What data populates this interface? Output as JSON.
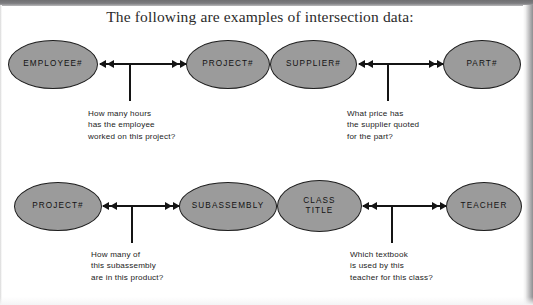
{
  "page": {
    "title": "The following are examples of intersection data:",
    "background_color": "#ffffff",
    "node_fill_color": "#9b9b9b",
    "node_border_color": "#1f1f1f",
    "line_color": "#141414"
  },
  "diagram": {
    "relationships": [
      {
        "id": "employee-project",
        "left_node": "EMPLOYEE#",
        "right_node": "PROJECT#",
        "caption": "How many hours\nhas the employee\nworked on this project?"
      },
      {
        "id": "supplier-part",
        "left_node": "SUPPLIER#",
        "right_node": "PART#",
        "caption": "What price has\nthe supplier quoted\nfor the part?"
      },
      {
        "id": "project-subassembly",
        "left_node": "PROJECT#",
        "right_node": "SUBASSEMBLY",
        "caption": "How many of\nthis subassembly\nare in this product?"
      },
      {
        "id": "class-teacher",
        "left_node": "CLASS\nTITLE",
        "right_node": "TEACHER",
        "caption": "Which textbook\nis used by this\nteacher for this class?"
      }
    ]
  }
}
